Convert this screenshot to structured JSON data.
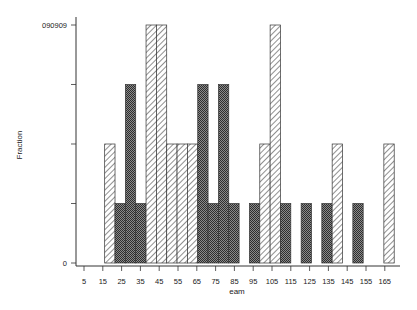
{
  "chart_data": {
    "type": "bar",
    "title": "",
    "xlabel": "eam",
    "ylabel": "Fraction",
    "xlim": [
      5,
      170
    ],
    "ylim": [
      0,
      0.090909
    ],
    "x_ticks": [
      5,
      15,
      25,
      35,
      45,
      55,
      65,
      75,
      85,
      95,
      105,
      115,
      125,
      135,
      145,
      155,
      165
    ],
    "y_tick_labels": [
      {
        "value": 0,
        "label": "0"
      },
      {
        "value": 0.090909,
        "label": "090909"
      }
    ],
    "y_minor_ticks": [
      0.022727,
      0.045455,
      0.068182
    ],
    "grid": false,
    "legend": null,
    "bin_width": 5.5,
    "patterns": {
      "hatched": "diagonal-lines",
      "dark": "crosshatch"
    },
    "bars": [
      {
        "start": 16.0,
        "value": 0.045455,
        "pattern": "hatched"
      },
      {
        "start": 21.5,
        "value": 0.022727,
        "pattern": "dark"
      },
      {
        "start": 27.0,
        "value": 0.068182,
        "pattern": "dark"
      },
      {
        "start": 32.5,
        "value": 0.022727,
        "pattern": "dark"
      },
      {
        "start": 38.0,
        "value": 0.090909,
        "pattern": "hatched"
      },
      {
        "start": 43.5,
        "value": 0.090909,
        "pattern": "hatched"
      },
      {
        "start": 49.0,
        "value": 0.045455,
        "pattern": "hatched"
      },
      {
        "start": 54.5,
        "value": 0.045455,
        "pattern": "hatched"
      },
      {
        "start": 60.0,
        "value": 0.045455,
        "pattern": "hatched"
      },
      {
        "start": 65.5,
        "value": 0.068182,
        "pattern": "dark"
      },
      {
        "start": 71.0,
        "value": 0.022727,
        "pattern": "dark"
      },
      {
        "start": 76.5,
        "value": 0.068182,
        "pattern": "dark"
      },
      {
        "start": 82.0,
        "value": 0.022727,
        "pattern": "dark"
      },
      {
        "start": 93.0,
        "value": 0.022727,
        "pattern": "dark"
      },
      {
        "start": 98.5,
        "value": 0.045455,
        "pattern": "hatched"
      },
      {
        "start": 104.0,
        "value": 0.090909,
        "pattern": "hatched"
      },
      {
        "start": 109.5,
        "value": 0.022727,
        "pattern": "dark"
      },
      {
        "start": 120.5,
        "value": 0.022727,
        "pattern": "dark"
      },
      {
        "start": 131.5,
        "value": 0.022727,
        "pattern": "dark"
      },
      {
        "start": 137.0,
        "value": 0.045455,
        "pattern": "hatched"
      },
      {
        "start": 148.0,
        "value": 0.022727,
        "pattern": "dark"
      },
      {
        "start": 164.5,
        "value": 0.045455,
        "pattern": "hatched"
      }
    ]
  }
}
